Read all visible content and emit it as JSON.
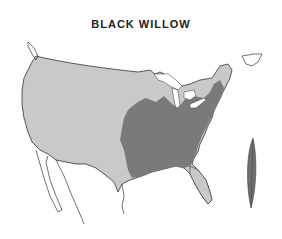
{
  "title": "BLACK WILLOW",
  "legend": {
    "native_range_color": "#7a7a7a",
    "outside_range_color": "#c9c9c9",
    "outline_color": "#333333"
  },
  "illustration": {
    "icon": "willow-leaf-icon",
    "color": "#6e6e6e"
  }
}
